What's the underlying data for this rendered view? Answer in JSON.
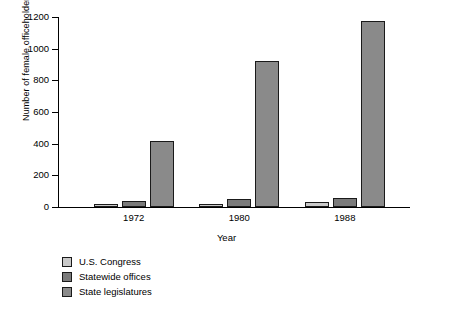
{
  "chart_data": {
    "type": "bar",
    "title": "",
    "xlabel": "Year",
    "ylabel": "Number of female officeholders",
    "categories": [
      "1972",
      "1980",
      "1988"
    ],
    "series": [
      {
        "name": "U.S. Congress",
        "values": [
          15,
          20,
          30
        ],
        "color": "#c9c9c9"
      },
      {
        "name": "Statewide offices",
        "values": [
          40,
          50,
          55
        ],
        "color": "#7a7a7a"
      },
      {
        "name": "State legislatures",
        "values": [
          420,
          920,
          1175
        ],
        "color": "#8a8a8a"
      }
    ],
    "ylim": [
      0,
      1200
    ],
    "ytick_labels": [
      "0",
      "200",
      "400",
      "600",
      "800",
      "1000",
      "1200"
    ],
    "ytick_values": [
      0,
      200,
      400,
      600,
      800,
      1000,
      1200
    ],
    "grid": false,
    "legend_position": "bottom-left"
  },
  "axes": {
    "y_title": "Number of female officeholders",
    "x_title": "Year"
  },
  "legend": {
    "items": [
      {
        "label": "U.S. Congress",
        "color": "#c9c9c9"
      },
      {
        "label": "Statewide offices",
        "color": "#7a7a7a"
      },
      {
        "label": "State legislatures",
        "color": "#8a8a8a"
      }
    ]
  }
}
